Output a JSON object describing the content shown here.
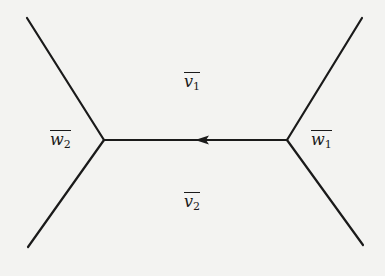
{
  "diagram": {
    "type": "tree-with-edge",
    "colors": {
      "background": "#f3f3f1",
      "stroke": "#1a1a1a"
    },
    "vertices": [
      {
        "id": "w2",
        "x": 104,
        "y": 140
      },
      {
        "id": "w1",
        "x": 287,
        "y": 140
      }
    ],
    "edges": [
      {
        "from": [
          27,
          18
        ],
        "to": [
          104,
          140
        ]
      },
      {
        "from": [
          104,
          140
        ],
        "to": [
          28,
          247
        ]
      },
      {
        "from": [
          362,
          18
        ],
        "to": [
          287,
          140
        ]
      },
      {
        "from": [
          287,
          140
        ],
        "to": [
          363,
          245
        ]
      },
      {
        "from": [
          287,
          140
        ],
        "to": [
          104,
          140
        ],
        "arrow": "left",
        "arrow_at": [
          200,
          140
        ]
      }
    ],
    "labels": {
      "v1": {
        "base": "v",
        "sub": "1"
      },
      "v2": {
        "base": "v",
        "sub": "2"
      },
      "w1": {
        "base": "w",
        "sub": "1"
      },
      "w2": {
        "base": "w",
        "sub": "2"
      }
    }
  }
}
